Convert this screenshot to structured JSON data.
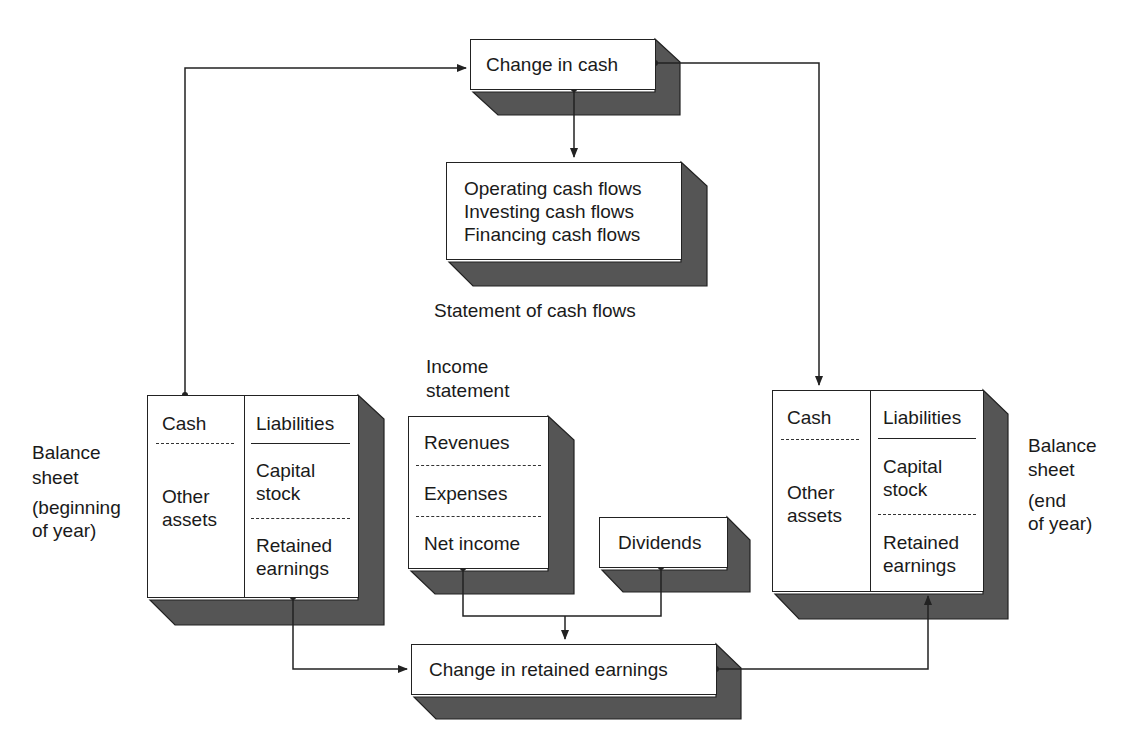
{
  "diagram": {
    "colors": {
      "line": "#222222",
      "shadow": "#555555",
      "box_fill": "#ffffff",
      "text": "#1a1a1a"
    },
    "change_in_cash": {
      "label": "Change in cash"
    },
    "cash_flows": {
      "lines": [
        "Operating cash flows",
        "Investing cash flows",
        "Financing cash flows"
      ],
      "caption": "Statement of cash flows"
    },
    "balance_sheet_begin": {
      "caption_lines": [
        "Balance",
        "sheet",
        "(beginning",
        "of year)"
      ],
      "assets": {
        "cash": "Cash",
        "other_lines": [
          "Other",
          "assets"
        ]
      },
      "equity": {
        "liabilities": "Liabilities",
        "capital_lines": [
          "Capital",
          "stock"
        ],
        "retained_lines": [
          "Retained",
          "earnings"
        ]
      }
    },
    "income_statement": {
      "caption_lines": [
        "Income",
        "statement"
      ],
      "rows": [
        "Revenues",
        "Expenses",
        "Net income"
      ]
    },
    "dividends": {
      "label": "Dividends"
    },
    "balance_sheet_end": {
      "caption_lines": [
        "Balance",
        "sheet",
        "(end",
        "of year)"
      ],
      "assets": {
        "cash": "Cash",
        "other_lines": [
          "Other",
          "assets"
        ]
      },
      "equity": {
        "liabilities": "Liabilities",
        "capital_lines": [
          "Capital",
          "stock"
        ],
        "retained_lines": [
          "Retained",
          "earnings"
        ]
      }
    },
    "change_in_retained_earnings": {
      "label": "Change in retained earnings"
    }
  }
}
